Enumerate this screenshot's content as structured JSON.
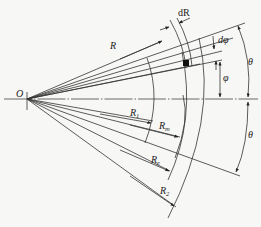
{
  "figure": {
    "origin_label": "O",
    "radius_label": "R",
    "dR_label": "dR",
    "dphi_label": "dφ",
    "phi_label": "φ",
    "theta_upper_label": "θ",
    "theta_lower_label": "θ",
    "radii": [
      {
        "base": "R",
        "sub": "1"
      },
      {
        "base": "R",
        "sub": "m"
      },
      {
        "base": "R",
        "sub": "e"
      },
      {
        "base": "R",
        "sub": "2"
      }
    ]
  },
  "colors": {
    "line": "#333333",
    "background": "#f7f7f5",
    "element_fill": "#111111"
  }
}
